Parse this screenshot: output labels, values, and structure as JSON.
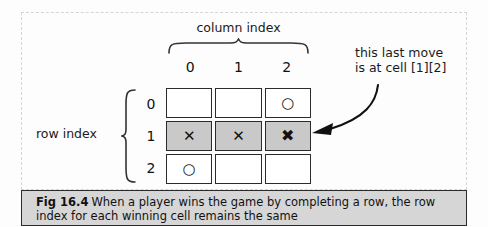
{
  "figure": {
    "column_index_label": "column index",
    "row_index_label": "row index",
    "column_numbers": [
      "0",
      "1",
      "2"
    ],
    "row_numbers": [
      "0",
      "1",
      "2"
    ],
    "annotation": {
      "line1": "this last move",
      "line2": "is at cell [1][2]"
    },
    "caption": {
      "fig_number": "Fig 16.4",
      "text": "When a player wins the game by completing a row, the row index for each winning cell remains the same"
    },
    "colors": {
      "background": "#fdfdfd",
      "cell_fill": "#ffffff",
      "cell_highlight": "#c9c9c9",
      "cell_border": "#2b2b2b",
      "caption_background": "#d6d6d6",
      "frame_dashed": "#d5d5d5",
      "text": "#111111"
    },
    "board": {
      "cells": [
        [
          {
            "mark": "",
            "icon": "empty-cell",
            "highlighted": false
          },
          {
            "mark": "",
            "icon": "empty-cell",
            "highlighted": false
          },
          {
            "mark": "○",
            "icon": "nought-mark",
            "highlighted": false
          }
        ],
        [
          {
            "mark": "✕",
            "icon": "cross-mark",
            "highlighted": true
          },
          {
            "mark": "✕",
            "icon": "cross-mark",
            "highlighted": true
          },
          {
            "mark": "✖",
            "icon": "cross-mark-bold",
            "highlighted": true
          }
        ],
        [
          {
            "mark": "○",
            "icon": "nought-mark",
            "highlighted": false
          },
          {
            "mark": "",
            "icon": "empty-cell",
            "highlighted": false
          },
          {
            "mark": "",
            "icon": "empty-cell",
            "highlighted": false
          }
        ]
      ]
    }
  }
}
